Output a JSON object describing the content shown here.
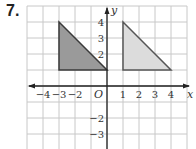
{
  "problem": {
    "number": "7."
  },
  "grid": {
    "cell_px": 16,
    "origin_px": [
      107,
      86
    ],
    "x_range": [
      -5,
      5
    ],
    "y_range": [
      -3,
      5
    ],
    "line_color": "#c8c8c8",
    "axis_color": "#222222"
  },
  "axes": {
    "x_name": "x",
    "y_name": "y",
    "origin_label": "O",
    "x_tick_labels": [
      {
        "value": -4,
        "text": "−4"
      },
      {
        "value": -3,
        "text": "−3"
      },
      {
        "value": -2,
        "text": "−2"
      },
      {
        "value": 1,
        "text": "1"
      },
      {
        "value": 2,
        "text": "2"
      },
      {
        "value": 3,
        "text": "3"
      },
      {
        "value": 4,
        "text": "4"
      }
    ],
    "y_tick_labels": [
      {
        "value": 4,
        "text": "4"
      },
      {
        "value": 3,
        "text": "3"
      },
      {
        "value": 2,
        "text": "2"
      },
      {
        "value": -2,
        "text": "−2"
      },
      {
        "value": -3,
        "text": "−3"
      }
    ]
  },
  "shapes": [
    {
      "name": "original-triangle",
      "vertices": [
        [
          -3,
          4
        ],
        [
          -3,
          1
        ],
        [
          0,
          1
        ]
      ],
      "fill": "#9a9a9a",
      "stroke": "#3a3a3a"
    },
    {
      "name": "image-triangle",
      "vertices": [
        [
          1,
          4
        ],
        [
          1,
          1
        ],
        [
          4,
          1
        ]
      ],
      "fill": "#dcdcdc",
      "stroke": "#555555"
    }
  ]
}
